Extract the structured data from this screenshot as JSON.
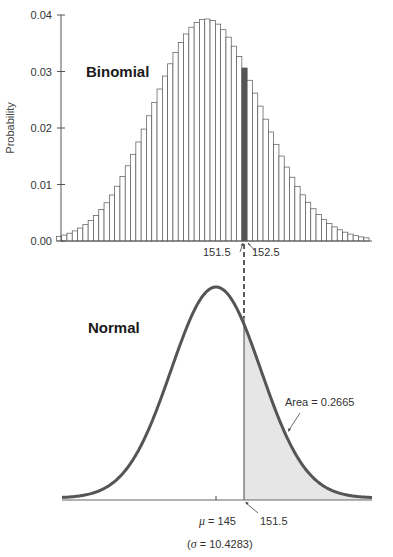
{
  "chart_data": [
    {
      "type": "bar",
      "title": "Binomial",
      "ylabel": "Probability",
      "xlabel": "",
      "ylim": [
        0,
        0.04
      ],
      "yticks": [
        "0.00",
        "0.01",
        "0.02",
        "0.03",
        "0.04"
      ],
      "grid": false,
      "n": 500,
      "p": 0.29,
      "x_range": [
        117,
        175
      ],
      "highlight": {
        "x": 152,
        "color": "#555555"
      },
      "bar_fill": "#ffffff",
      "bar_stroke": "#555555",
      "annotations": [
        {
          "text": "151.5",
          "x": 151.5
        },
        {
          "text": "152.5",
          "x": 152.5
        }
      ]
    },
    {
      "type": "area",
      "title": "Normal",
      "mean": 145,
      "sd": 10.4283,
      "shaded_from": 151.5,
      "shaded_area": 0.2665,
      "shade_color": "#e6e6e6",
      "curve_color": "#555555",
      "annotations": [
        {
          "text": "Area = 0.2665"
        },
        {
          "text": "μ = 145",
          "x": 145
        },
        {
          "text": "151.5",
          "x": 151.5
        },
        {
          "text": "(σ = 10.4283)"
        }
      ]
    }
  ],
  "labels": {
    "binomial_title": "Binomial",
    "normal_title": "Normal",
    "ylabel": "Probability",
    "yticks": [
      "0.00",
      "0.01",
      "0.02",
      "0.03",
      "0.04"
    ],
    "left_boundary": "151.5",
    "right_boundary": "152.5",
    "area_label": "Area = 0.2665",
    "mu_symbol": "μ",
    "mu_value": " = 145",
    "normal_cut": "151.5",
    "sigma_open": "(",
    "sigma_symbol": "σ",
    "sigma_value": " = 10.4283)"
  }
}
